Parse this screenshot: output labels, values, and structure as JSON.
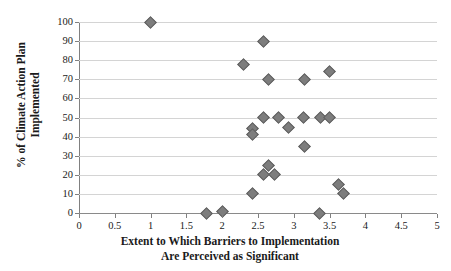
{
  "chart_data": {
    "type": "scatter",
    "title": "",
    "xlabel": "Extent to Which Barriers to Implementation Are Perceived as Significant",
    "xlabel_line1": "Extent to Which Barriers to Implementation",
    "xlabel_line2": "Are Perceived as Significant",
    "ylabel": "% of Climate Action Plan Implemented",
    "ylabel_line1": "% of Climate Action Plan",
    "ylabel_line2": "Implemented",
    "xlim": [
      0,
      5
    ],
    "ylim": [
      0,
      100
    ],
    "xticks": [
      0,
      0.5,
      1,
      1.5,
      2,
      2.5,
      3,
      3.5,
      4,
      4.5,
      5
    ],
    "xtick_labels": [
      "0",
      "0.5",
      "1",
      "1.5",
      "2",
      "2.5",
      "3",
      "3.5",
      "4",
      "4.5",
      "5"
    ],
    "yticks": [
      0,
      10,
      20,
      30,
      40,
      50,
      60,
      70,
      80,
      90,
      100
    ],
    "ytick_labels": [
      "0",
      "10",
      "20",
      "30",
      "40",
      "50",
      "60",
      "70",
      "80",
      "90",
      "100"
    ],
    "grid": "horizontal",
    "legend": "none",
    "marker": "diamond",
    "marker_color": "#7d7d7d",
    "marker_edge_color": "#5f5f5f",
    "gridline_color": "#d4d4d4",
    "axis_color": "#808080",
    "points": [
      {
        "x": 1.0,
        "y": 100
      },
      {
        "x": 2.58,
        "y": 90
      },
      {
        "x": 2.3,
        "y": 78
      },
      {
        "x": 3.5,
        "y": 74
      },
      {
        "x": 2.65,
        "y": 70
      },
      {
        "x": 3.15,
        "y": 70
      },
      {
        "x": 2.57,
        "y": 50
      },
      {
        "x": 2.78,
        "y": 50
      },
      {
        "x": 3.13,
        "y": 50
      },
      {
        "x": 3.37,
        "y": 50
      },
      {
        "x": 3.5,
        "y": 50
      },
      {
        "x": 2.93,
        "y": 45
      },
      {
        "x": 2.43,
        "y": 44
      },
      {
        "x": 2.42,
        "y": 41
      },
      {
        "x": 3.15,
        "y": 35
      },
      {
        "x": 2.64,
        "y": 25
      },
      {
        "x": 2.58,
        "y": 20
      },
      {
        "x": 2.73,
        "y": 20
      },
      {
        "x": 3.62,
        "y": 15
      },
      {
        "x": 2.43,
        "y": 10
      },
      {
        "x": 3.7,
        "y": 10
      },
      {
        "x": 2.0,
        "y": 1
      },
      {
        "x": 1.78,
        "y": 0
      },
      {
        "x": 3.36,
        "y": 0
      }
    ]
  }
}
